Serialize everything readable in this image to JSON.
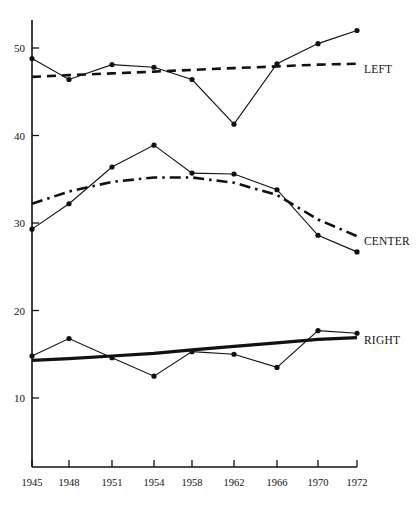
{
  "chart_data": {
    "type": "line",
    "title": "",
    "subtitle": "",
    "xlabel": "",
    "ylabel": "",
    "x": [
      1945,
      1948,
      1951,
      1954,
      1958,
      1962,
      1966,
      1970,
      1972
    ],
    "categories": [
      "1945",
      "1948",
      "1951",
      "1954",
      "1958",
      "1962",
      "1966",
      "1970",
      "1972"
    ],
    "xtick_labels": [
      "1945",
      "1948",
      "1951",
      "1954",
      "1958",
      "1962",
      "1966",
      "1970",
      "1972"
    ],
    "ytick_labels": [
      "10",
      "20",
      "30",
      "40",
      "50"
    ],
    "yticks": [
      10,
      20,
      30,
      40,
      50
    ],
    "ylim": [
      3,
      54
    ],
    "xlim": [
      1944,
      1973
    ],
    "grid": false,
    "legend_position": "right-inline",
    "series": [
      {
        "name": "LEFT",
        "label": "LEFT",
        "style": "markers-solid-thin",
        "values": [
          48.8,
          46.4,
          48.1,
          47.8,
          46.4,
          41.3,
          48.2,
          50.5,
          52.0
        ]
      },
      {
        "name": "LEFT trend",
        "label": "LEFT",
        "style": "dashed",
        "values": [
          46.7,
          46.9,
          47.1,
          47.3,
          47.5,
          47.7,
          47.9,
          48.1,
          48.2
        ]
      },
      {
        "name": "CENTER",
        "label": "CENTER",
        "style": "markers-solid-thin",
        "values": [
          29.3,
          32.2,
          36.4,
          38.9,
          35.7,
          35.6,
          33.8,
          28.6,
          26.7
        ]
      },
      {
        "name": "CENTER trend",
        "label": "CENTER",
        "style": "dash-dot",
        "values": [
          32.2,
          33.6,
          34.7,
          35.2,
          35.2,
          34.6,
          33.2,
          30.4,
          28.5
        ]
      },
      {
        "name": "RIGHT",
        "label": "RIGHT",
        "style": "markers-solid-thin",
        "values": [
          14.8,
          16.8,
          14.6,
          12.5,
          15.3,
          15.0,
          13.5,
          17.7,
          17.4
        ]
      },
      {
        "name": "RIGHT trend",
        "label": "RIGHT",
        "style": "thick-solid",
        "values": [
          14.3,
          14.5,
          14.8,
          15.1,
          15.5,
          15.9,
          16.3,
          16.7,
          16.9
        ]
      }
    ],
    "annotations": [
      {
        "text": "LEFT",
        "x": 1973.0,
        "y": 47.6
      },
      {
        "text": "CENTER",
        "x": 1973.0,
        "y": 28.0
      },
      {
        "text": "RIGHT",
        "x": 1973.0,
        "y": 16.6
      }
    ]
  }
}
